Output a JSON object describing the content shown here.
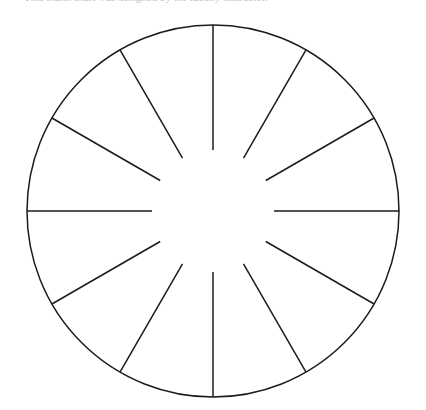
{
  "page": {
    "background_color": "#ffffff",
    "width": 426,
    "height": 410
  },
  "caption": {
    "text": "This blank chart was designed by the faculty instructor.",
    "color": "#8e8e96",
    "note": "partially-cropped-top-line"
  },
  "figure": {
    "name": "blank-pie-chart-wheel",
    "stroke_color": "#1b1b1b",
    "fill_color": "#ffffff",
    "stroke_width": 1.5,
    "center_x": 213,
    "center_y": 211,
    "outer_radius": 186,
    "inner_radius": 61,
    "segment_count": 12,
    "segment_angle_degrees": 30,
    "start_angle_degrees": 0,
    "spoke_labels": [
      "",
      "",
      "",
      "",
      "",
      "",
      "",
      "",
      "",
      "",
      "",
      ""
    ]
  },
  "chart_data": {
    "type": "pie",
    "title": "",
    "categories": [
      "1",
      "2",
      "3",
      "4",
      "5",
      "6",
      "7",
      "8",
      "9",
      "10",
      "11",
      "12"
    ],
    "values": [
      1,
      1,
      1,
      1,
      1,
      1,
      1,
      1,
      1,
      1,
      1,
      1
    ],
    "labels_shown": false,
    "legend": [],
    "legend_position": "none",
    "grid": false,
    "annotations": [],
    "note": "Empty/blank pie chart template: 12 equal unlabeled sectors drawn as outline only, spokes stop short of the center leaving an open hub."
  }
}
